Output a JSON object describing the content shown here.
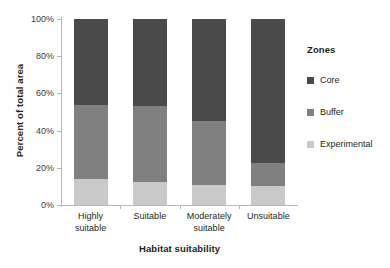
{
  "chart_data": {
    "type": "bar",
    "subtype": "stacked-bar-100-percent",
    "title": "",
    "xlabel": "Habitat suitability",
    "ylabel": "Percent of total area",
    "categories": [
      "Highly suitable",
      "Suitable",
      "Moderately suitable",
      "Unsuitable"
    ],
    "category_lines": [
      [
        "Highly",
        "suitable"
      ],
      [
        "Suitable"
      ],
      [
        "Moderately",
        "suitable"
      ],
      [
        "Unsuitable"
      ]
    ],
    "series": [
      {
        "name": "Core",
        "color": "#4a4a4a",
        "values": [
          46,
          47,
          55,
          77.5
        ]
      },
      {
        "name": "Buffer",
        "color": "#808080",
        "values": [
          40,
          40.5,
          34,
          12.5
        ]
      },
      {
        "name": "Experimental",
        "color": "#c9c9c9",
        "values": [
          14,
          12.5,
          11,
          10
        ]
      }
    ],
    "stack_order_bottom_to_top": [
      "Experimental",
      "Buffer",
      "Core"
    ],
    "cumulative_tops": {
      "Experimental": [
        14,
        12.5,
        11,
        10
      ],
      "Buffer": [
        54,
        53,
        45,
        22.5
      ],
      "Core": [
        100,
        100,
        100,
        100
      ]
    },
    "ylim": [
      0,
      100
    ],
    "ytick_values": [
      0,
      20,
      40,
      60,
      80,
      100
    ],
    "ytick_labels": [
      "0%",
      "20%",
      "40%",
      "60%",
      "80%",
      "100%"
    ],
    "grid": false,
    "legend_position": "right",
    "legend_title": "Zones"
  }
}
